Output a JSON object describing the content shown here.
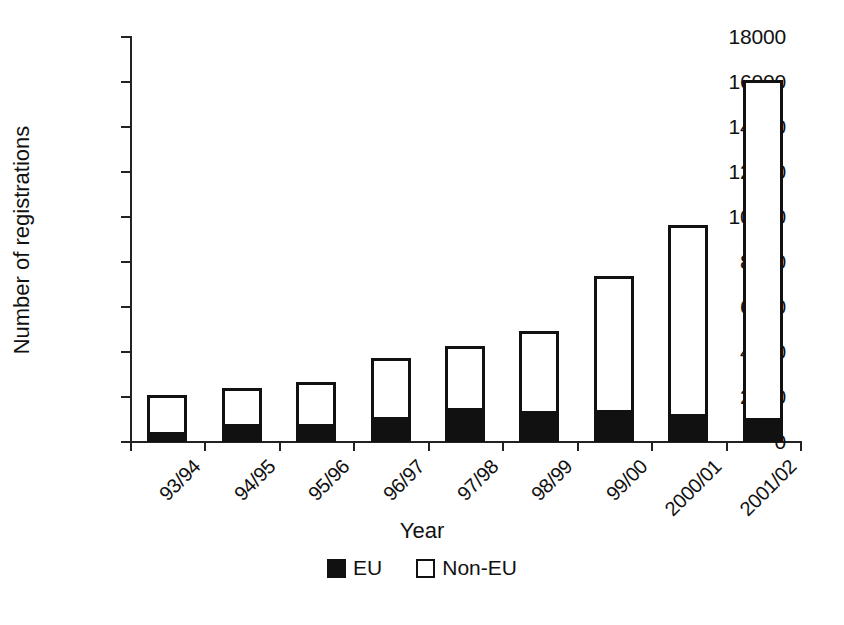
{
  "chart_data": {
    "type": "bar",
    "stacked": true,
    "title": "",
    "xlabel": "Year",
    "ylabel": "Number of registrations",
    "categories": [
      "93/94",
      "94/95",
      "95/96",
      "96/97",
      "97/98",
      "98/99",
      "99/00",
      "2000/01",
      "2001/02"
    ],
    "series": [
      {
        "name": "EU",
        "color": "#111111",
        "values": [
          440,
          800,
          800,
          1120,
          1510,
          1380,
          1430,
          1250,
          1080
        ]
      },
      {
        "name": "Non-EU",
        "color": "#ffffff",
        "values": [
          1660,
          1600,
          1870,
          2630,
          2760,
          3570,
          5970,
          8400,
          15020
        ]
      }
    ],
    "totals": [
      2100,
      2400,
      2670,
      3750,
      4270,
      4950,
      7400,
      9650,
      16100
    ],
    "ylim": [
      0,
      18000
    ],
    "yticks": [
      0,
      2000,
      4000,
      6000,
      8000,
      10000,
      12000,
      14000,
      16000,
      18000
    ],
    "ytick_labels": [
      "0",
      "2000",
      "4000",
      "6000",
      "8000",
      "10000",
      "12000",
      "14000",
      "16000",
      "18000"
    ],
    "grid": false,
    "legend": {
      "position": "bottom-center",
      "entries": [
        "EU",
        "Non-EU"
      ]
    },
    "x_label_rotation": -45
  },
  "legend": {
    "items": [
      {
        "label": "EU",
        "style": "filled"
      },
      {
        "label": "Non-EU",
        "style": "open"
      }
    ]
  },
  "axes": {
    "x_title": "Year",
    "y_title": "Number of registrations"
  },
  "colors": {
    "eu_fill": "#111111",
    "non_eu_fill": "#ffffff",
    "outline": "#111111",
    "background": "#ffffff"
  }
}
